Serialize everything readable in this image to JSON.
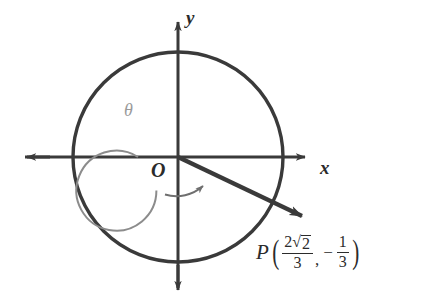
{
  "figure": {
    "type": "unit-circle-angle-diagram",
    "axes": {
      "x_label": "x",
      "y_label": "y",
      "origin_label": "O"
    },
    "angle": {
      "symbol": "θ",
      "direction": "counterclockwise",
      "arc_color": "#8c8c8c"
    },
    "point": {
      "name": "P",
      "open_paren": "(",
      "close_paren": ")",
      "comma": ",",
      "minus": "−",
      "x_coordinate": {
        "numerator_coefficient": "2",
        "radical_sign": "√",
        "radicand": "2",
        "denominator": "3"
      },
      "y_coordinate": {
        "numerator": "1",
        "denominator": "3"
      }
    },
    "colors": {
      "stroke": "#3a3a3a",
      "light_stroke": "#8c8c8c",
      "background": "#ffffff"
    },
    "geometry": {
      "center_x": 178,
      "center_y": 157,
      "outer_radius": 105,
      "arc_radius": 40,
      "terminal_angle_degrees": -19.5
    }
  }
}
